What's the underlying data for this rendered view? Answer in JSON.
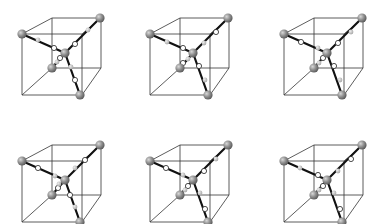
{
  "figure": {
    "colors": {
      "background": "#ffffff",
      "cube_edge": "#333333",
      "bond": "#111111",
      "large_atom": "#8a8a8a",
      "large_atom_highlight": "#c8c8c8",
      "small_gray_atom": "#b8b8b8",
      "small_white_atom": "#ffffff",
      "small_atom_stroke": "#222222"
    },
    "cube_template": {
      "front": [
        [
          22,
          34
        ],
        [
          82,
          34
        ],
        [
          82,
          95
        ],
        [
          22,
          95
        ]
      ],
      "back": [
        [
          52,
          18
        ],
        [
          101,
          18
        ],
        [
          101,
          68
        ],
        [
          52,
          68
        ]
      ],
      "corner_atoms": [
        [
          22,
          34
        ],
        [
          100,
          18
        ],
        [
          80,
          95
        ],
        [
          52,
          68
        ]
      ],
      "center_atom": [
        65,
        53
      ]
    },
    "cubes": [
      {
        "id": "cube-r1-c1",
        "dx": 0,
        "dy": 0,
        "small_atoms": [
          {
            "x": 38,
            "y": 40,
            "type": "gray"
          },
          {
            "x": 54,
            "y": 48,
            "type": "white"
          },
          {
            "x": 88,
            "y": 30,
            "type": "gray"
          },
          {
            "x": 75,
            "y": 44,
            "type": "white"
          },
          {
            "x": 57,
            "y": 62,
            "type": "gray"
          },
          {
            "x": 60,
            "y": 58,
            "type": "white"
          },
          {
            "x": 71,
            "y": 67,
            "type": "gray"
          },
          {
            "x": 75,
            "y": 80,
            "type": "white"
          }
        ]
      },
      {
        "id": "cube-r1-c2",
        "dx": 128,
        "dy": 0,
        "small_atoms": [
          {
            "x": 39,
            "y": 42,
            "type": "gray"
          },
          {
            "x": 55,
            "y": 48,
            "type": "white"
          },
          {
            "x": 88,
            "y": 32,
            "type": "white"
          },
          {
            "x": 76,
            "y": 43,
            "type": "gray"
          },
          {
            "x": 55,
            "y": 63,
            "type": "white"
          },
          {
            "x": 60,
            "y": 59,
            "type": "gray"
          },
          {
            "x": 71,
            "y": 66,
            "type": "white"
          },
          {
            "x": 77,
            "y": 80,
            "type": "gray"
          }
        ]
      },
      {
        "id": "cube-r1-c3",
        "dx": 262,
        "dy": 0,
        "small_atoms": [
          {
            "x": 39,
            "y": 42,
            "type": "white"
          },
          {
            "x": 56,
            "y": 48,
            "type": "gray"
          },
          {
            "x": 89,
            "y": 32,
            "type": "gray"
          },
          {
            "x": 76,
            "y": 43,
            "type": "white"
          },
          {
            "x": 57,
            "y": 63,
            "type": "gray"
          },
          {
            "x": 61,
            "y": 58,
            "type": "white"
          },
          {
            "x": 72,
            "y": 66,
            "type": "white"
          },
          {
            "x": 78,
            "y": 80,
            "type": "gray"
          }
        ]
      },
      {
        "id": "cube-r2-c1",
        "dx": 0,
        "dy": 127,
        "small_atoms": [
          {
            "x": 38,
            "y": 41,
            "type": "white"
          },
          {
            "x": 55,
            "y": 49,
            "type": "gray"
          },
          {
            "x": 85,
            "y": 33,
            "type": "white"
          },
          {
            "x": 75,
            "y": 41,
            "type": "gray"
          },
          {
            "x": 58,
            "y": 61,
            "type": "white"
          },
          {
            "x": 59,
            "y": 57,
            "type": "gray"
          },
          {
            "x": 70,
            "y": 68,
            "type": "white"
          },
          {
            "x": 75,
            "y": 80,
            "type": "gray"
          }
        ]
      },
      {
        "id": "cube-r2-c2",
        "dx": 128,
        "dy": 127,
        "small_atoms": [
          {
            "x": 38,
            "y": 41,
            "type": "white"
          },
          {
            "x": 55,
            "y": 48,
            "type": "gray"
          },
          {
            "x": 88,
            "y": 32,
            "type": "gray"
          },
          {
            "x": 76,
            "y": 44,
            "type": "white"
          },
          {
            "x": 60,
            "y": 59,
            "type": "white"
          },
          {
            "x": 57,
            "y": 63,
            "type": "gray"
          },
          {
            "x": 72,
            "y": 66,
            "type": "gray"
          },
          {
            "x": 77,
            "y": 82,
            "type": "white"
          }
        ]
      },
      {
        "id": "cube-r2-c3",
        "dx": 262,
        "dy": 127,
        "small_atoms": [
          {
            "x": 38,
            "y": 41,
            "type": "gray"
          },
          {
            "x": 56,
            "y": 48,
            "type": "white"
          },
          {
            "x": 89,
            "y": 32,
            "type": "white"
          },
          {
            "x": 76,
            "y": 44,
            "type": "gray"
          },
          {
            "x": 61,
            "y": 59,
            "type": "white"
          },
          {
            "x": 57,
            "y": 63,
            "type": "gray"
          },
          {
            "x": 72,
            "y": 66,
            "type": "gray"
          },
          {
            "x": 78,
            "y": 82,
            "type": "white"
          }
        ]
      }
    ]
  }
}
